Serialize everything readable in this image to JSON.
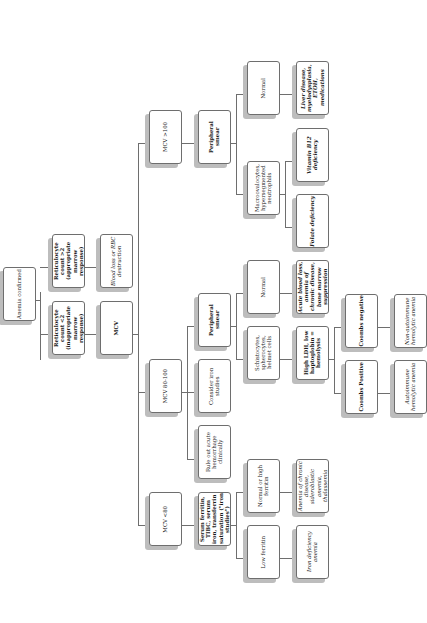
{
  "diagram": {
    "type": "flowchart",
    "orientation": "rotated-90-ccw",
    "nodes": {
      "root": "Anemia confirmed",
      "retic_low": "Reticulocyte count <2 (inappropriate marrow response)",
      "retic_high": "Reticulocyte count >2 (appropriate marrow response)",
      "mcv": "MCV",
      "blood_loss": "Blood loss or RBC destruction",
      "mcv_gt100": "MCV >100",
      "mcv_80_100": "MCV 80-100",
      "mcv_lt80": "MCV <80",
      "smear_macro": "Peripheral smear",
      "smear_normo": "Peripheral smear",
      "consider_iron": "Consider iron studies",
      "rule_out_hemorrhage": "Rule out acute hemorrhage clinically",
      "iron_studies": "Serum ferritin, TIBC, serum iron, transferrin saturation (\"iron studies\")",
      "macro_normal": "Normal",
      "macro_cells": "Macroovalocytes, hypersegmented neutrophils",
      "liver_disease": "Liver disease, myelodysplasia, ETOH, medications",
      "b12": "Vitamin B12 deficiency",
      "folate": "Folate deficiency",
      "normo_normal": "Normal",
      "schisto": "Schistocytes, spherocytes, helmet cells",
      "acute_blood_loss": "Acute blood loss, anemia of chronic disease, bone marrow suppression",
      "hemolysis": "High LDH, low haptoglobin = hemolysis",
      "coombs_neg": "Coombs negative",
      "coombs_pos": "Coombs Positive",
      "non_autoimmune": "Non-autoimmune hemolytic anemia",
      "autoimmune": "Autoimmune hemolytic anemia",
      "normal_high_ferritin": "Normal or high ferritin",
      "low_ferritin": "Low ferritin",
      "acd": "Anemia of chronic disease, sideroblastic anemia, thalassemia",
      "ida": "Iron deficiency anemia"
    },
    "edges": [
      [
        "root",
        "retic_low"
      ],
      [
        "root",
        "retic_high"
      ],
      [
        "retic_low",
        "mcv"
      ],
      [
        "retic_high",
        "blood_loss"
      ],
      [
        "mcv",
        "mcv_gt100"
      ],
      [
        "mcv",
        "mcv_80_100"
      ],
      [
        "mcv",
        "mcv_lt80"
      ],
      [
        "mcv_gt100",
        "smear_macro"
      ],
      [
        "smear_macro",
        "macro_normal"
      ],
      [
        "smear_macro",
        "macro_cells"
      ],
      [
        "macro_normal",
        "liver_disease"
      ],
      [
        "macro_cells",
        "b12"
      ],
      [
        "macro_cells",
        "folate"
      ],
      [
        "mcv_80_100",
        "smear_normo"
      ],
      [
        "mcv_80_100",
        "consider_iron"
      ],
      [
        "mcv_80_100",
        "rule_out_hemorrhage"
      ],
      [
        "smear_normo",
        "normo_normal"
      ],
      [
        "smear_normo",
        "schisto"
      ],
      [
        "normo_normal",
        "acute_blood_loss"
      ],
      [
        "schisto",
        "hemolysis"
      ],
      [
        "hemolysis",
        "coombs_neg"
      ],
      [
        "hemolysis",
        "coombs_pos"
      ],
      [
        "coombs_neg",
        "non_autoimmune"
      ],
      [
        "coombs_pos",
        "autoimmune"
      ],
      [
        "mcv_lt80",
        "iron_studies"
      ],
      [
        "iron_studies",
        "normal_high_ferritin"
      ],
      [
        "iron_studies",
        "low_ferritin"
      ],
      [
        "normal_high_ferritin",
        "acd"
      ],
      [
        "low_ferritin",
        "ida"
      ]
    ]
  }
}
